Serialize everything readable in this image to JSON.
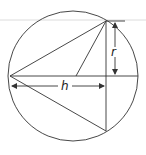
{
  "figure": {
    "labels": {
      "height": "h",
      "radius": "r"
    },
    "colors": {
      "stroke": "#333333",
      "background": "#ffffff",
      "scan_line": "#d8d8d8"
    },
    "geometry": {
      "circle": {
        "cx": 73,
        "cy": 75,
        "r": 65
      },
      "apex_left": {
        "x": 10,
        "y": 75
      },
      "base_top": {
        "x": 106,
        "y": 21
      },
      "base_bottom": {
        "x": 106,
        "y": 131
      },
      "center_point": {
        "x": 76,
        "y": 75
      }
    }
  }
}
